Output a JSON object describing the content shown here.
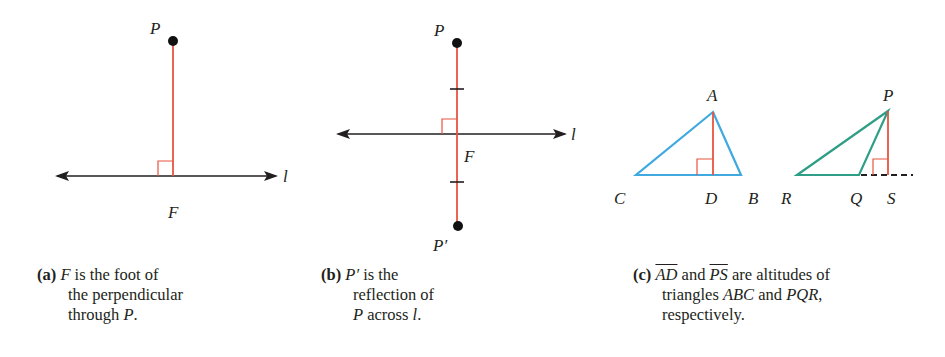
{
  "colors": {
    "line": "#231f20",
    "perpendicular": "#e8543f",
    "triangle_abc": "#3fa9e0",
    "triangle_pqr": "#2e9e86",
    "point": "#111111"
  },
  "panel_a": {
    "labels": {
      "point": "P",
      "foot": "F",
      "line": "l"
    },
    "caption": {
      "tag": "(a)",
      "line1_var": "F",
      "line1_rest": " is the foot of",
      "line2": "the perpendicular",
      "line3_text": "through ",
      "line3_var": "P",
      "line3_end": "."
    }
  },
  "panel_b": {
    "labels": {
      "point": "P",
      "reflection": "P′",
      "foot": "F",
      "line": "l"
    },
    "caption": {
      "tag": "(b)",
      "line1_var": "P′",
      "line1_rest": " is the",
      "line2": "reflection of",
      "line3_var": "P",
      "line3_text": " across ",
      "line3_var2": "l",
      "line3_end": "."
    }
  },
  "panel_c": {
    "labels": {
      "A": "A",
      "B": "B",
      "C": "C",
      "D": "D",
      "P": "P",
      "Q": "Q",
      "R": "R",
      "S": "S"
    },
    "caption": {
      "tag": "(c)",
      "seg1": "AD",
      "and1": " and ",
      "seg2": "PS",
      "line1_rest": " are altitudes of",
      "line2_text": "triangles ",
      "tri1": "ABC",
      "and2": " and ",
      "tri2": "PQR",
      "line2_end": ",",
      "line3": "respectively."
    }
  }
}
